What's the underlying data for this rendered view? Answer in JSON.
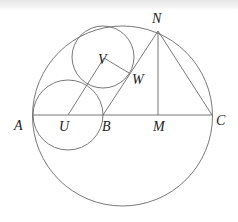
{
  "diagram": {
    "type": "geometry",
    "points": {
      "A": {
        "label": "A",
        "x": 33,
        "y": 115
      },
      "U": {
        "label": "U",
        "x": 68,
        "y": 115
      },
      "B": {
        "label": "B",
        "x": 103,
        "y": 115
      },
      "M": {
        "label": "M",
        "x": 158,
        "y": 115
      },
      "C": {
        "label": "C",
        "x": 212,
        "y": 115
      },
      "N": {
        "label": "N",
        "x": 158,
        "y": 31
      },
      "V": {
        "label": "V",
        "x": 104,
        "y": 58
      },
      "W": {
        "label": "W",
        "x": 128,
        "y": 72
      }
    },
    "circles": [
      {
        "name": "big-circle",
        "cx": 122.5,
        "cy": 116,
        "r": 90
      },
      {
        "name": "circle-U",
        "cx": 68,
        "cy": 115,
        "r": 35
      },
      {
        "name": "circle-V",
        "cx": 103,
        "cy": 57,
        "r": 31
      }
    ],
    "segments": [
      [
        "A",
        "C"
      ],
      [
        "B",
        "N"
      ],
      [
        "N",
        "M"
      ],
      [
        "N",
        "C"
      ],
      [
        "U",
        "V"
      ],
      [
        "V",
        "W"
      ]
    ],
    "labels": [
      {
        "text": "A",
        "x": 14,
        "y": 130
      },
      {
        "text": "U",
        "x": 59,
        "y": 131
      },
      {
        "text": "B",
        "x": 102,
        "y": 131
      },
      {
        "text": "M",
        "x": 153,
        "y": 131
      },
      {
        "text": "C",
        "x": 216,
        "y": 125
      },
      {
        "text": "N",
        "x": 152,
        "y": 23
      },
      {
        "text": "V",
        "x": 98,
        "y": 64
      },
      {
        "text": "W",
        "x": 132,
        "y": 84
      }
    ]
  }
}
